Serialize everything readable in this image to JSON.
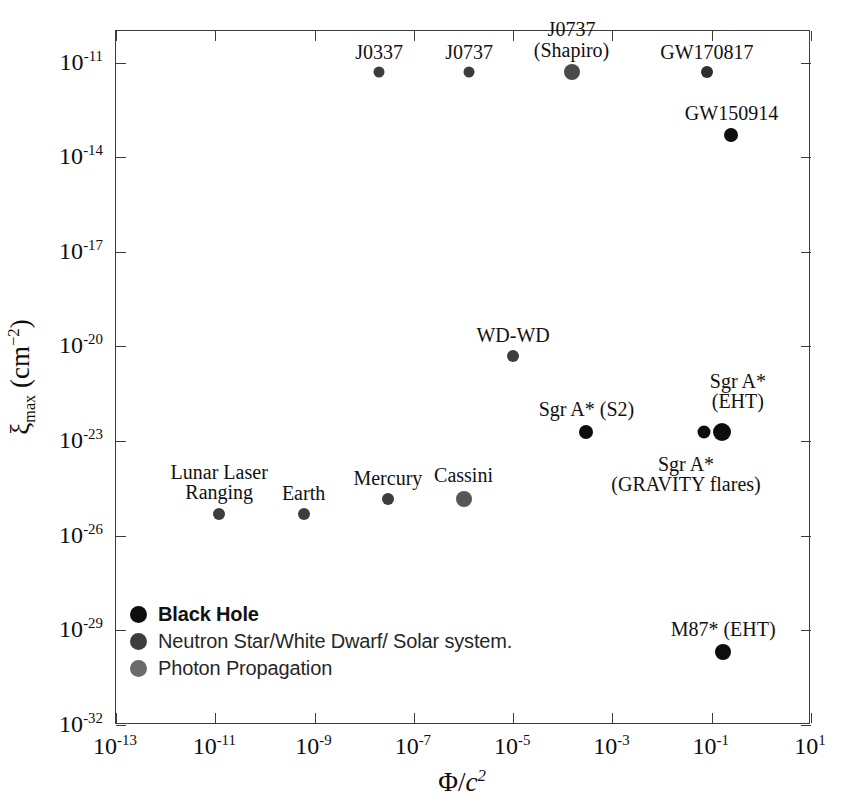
{
  "chart_data": {
    "type": "scatter",
    "title": "",
    "xlabel": "Φ/c²",
    "ylabel": "ξ_max (cm⁻²)",
    "xscale": "log",
    "yscale": "log",
    "xlim": [
      1e-13,
      10
    ],
    "ylim": [
      1e-32,
      1e-10
    ],
    "grid": false,
    "legend_position": "lower-left-inside",
    "xticks": [
      {
        "label_mantissa": "10",
        "exp": "-13",
        "value": 1e-13
      },
      {
        "label_mantissa": "10",
        "exp": "-11",
        "value": 1e-11
      },
      {
        "label_mantissa": "10",
        "exp": "-9",
        "value": 1e-09
      },
      {
        "label_mantissa": "10",
        "exp": "-7",
        "value": 1e-07
      },
      {
        "label_mantissa": "10",
        "exp": "-5",
        "value": 1e-05
      },
      {
        "label_mantissa": "10",
        "exp": "-3",
        "value": 0.001
      },
      {
        "label_mantissa": "10",
        "exp": "-1",
        "value": 0.1
      },
      {
        "label_mantissa": "10",
        "exp": "1",
        "value": 10
      }
    ],
    "yticks": [
      {
        "label_mantissa": "10",
        "exp": "-11",
        "value": 1e-11
      },
      {
        "label_mantissa": "10",
        "exp": "-14",
        "value": 1e-14
      },
      {
        "label_mantissa": "10",
        "exp": "-17",
        "value": 1e-17
      },
      {
        "label_mantissa": "10",
        "exp": "-20",
        "value": 1e-20
      },
      {
        "label_mantissa": "10",
        "exp": "-23",
        "value": 1e-23
      },
      {
        "label_mantissa": "10",
        "exp": "-26",
        "value": 1e-26
      },
      {
        "label_mantissa": "10",
        "exp": "-29",
        "value": 1e-29
      },
      {
        "label_mantissa": "10",
        "exp": "-32",
        "value": 1e-32
      }
    ],
    "legend": [
      {
        "label": "Black Hole",
        "color": "#0d0d0d",
        "category": "black-hole"
      },
      {
        "label": "Neutron Star/White Dwarf/ Solar system.",
        "color": "#3d3d3d",
        "category": "ns-wd-solar"
      },
      {
        "label": "Photon Propagation",
        "color": "#6b6b6b",
        "category": "photon-propagation"
      }
    ],
    "points": [
      {
        "name": "J0337",
        "label": "J0337",
        "x": 2e-08,
        "y": 5e-12,
        "category": "ns-wd-solar",
        "color": "#3d3d3d",
        "size": 11,
        "label_lines": [
          "J0337"
        ],
        "label_dx": 0,
        "label_dy": -30
      },
      {
        "name": "J0737",
        "label": "J0737",
        "x": 1.3e-06,
        "y": 5e-12,
        "category": "ns-wd-solar",
        "color": "#3d3d3d",
        "size": 11,
        "label_lines": [
          "J0737"
        ],
        "label_dx": 0,
        "label_dy": -30
      },
      {
        "name": "J0737 (Shapiro)",
        "label": "J0737 (Shapiro)",
        "x": 0.00015,
        "y": 5e-12,
        "category": "photon-propagation",
        "color": "#4a4a4a",
        "size": 16,
        "label_lines": [
          "J0737",
          "(Shapiro)"
        ],
        "label_dx": 0,
        "label_dy": -53
      },
      {
        "name": "GW170817",
        "label": "GW170817",
        "x": 0.08,
        "y": 5e-12,
        "category": "ns-wd-solar",
        "color": "#2e2e2e",
        "size": 12,
        "label_lines": [
          "GW170817"
        ],
        "label_dx": 0,
        "label_dy": -30
      },
      {
        "name": "GW150914",
        "label": "GW150914",
        "x": 0.25,
        "y": 5e-14,
        "category": "black-hole",
        "color": "#0d0d0d",
        "size": 14,
        "label_lines": [
          "GW150914"
        ],
        "label_dx": 0,
        "label_dy": -32
      },
      {
        "name": "WD-WD",
        "label": "WD-WD",
        "x": 1e-05,
        "y": 5e-21,
        "category": "ns-wd-solar",
        "color": "#3d3d3d",
        "size": 12,
        "label_lines": [
          "WD-WD"
        ],
        "label_dx": 0,
        "label_dy": -31
      },
      {
        "name": "Sgr A* (S2)",
        "label": "Sgr A* (S2)",
        "x": 0.0003,
        "y": 2e-23,
        "category": "black-hole",
        "color": "#0d0d0d",
        "size": 14,
        "label_lines": [
          "Sgr A* (S2)"
        ],
        "label_dx": 0,
        "label_dy": -33
      },
      {
        "name": "Sgr A* (GRAVITY flares)",
        "label": "Sgr A* (GRAVITY flares)",
        "x": 0.07,
        "y": 2e-23,
        "category": "black-hole",
        "color": "#0d0d0d",
        "size": 13,
        "label_lines": [
          "Sgr A*",
          "(GRAVITY flares)"
        ],
        "label_dx": -18,
        "label_dy": 22
      },
      {
        "name": "Sgr A* (EHT)",
        "label": "Sgr A* (EHT)",
        "x": 0.16,
        "y": 2e-23,
        "category": "black-hole",
        "color": "#0d0d0d",
        "size": 18,
        "label_lines": [
          "Sgr A*",
          "(EHT)"
        ],
        "label_dx": 16,
        "label_dy": -61
      },
      {
        "name": "Mercury",
        "label": "Mercury",
        "x": 3e-08,
        "y": 1.5e-25,
        "category": "ns-wd-solar",
        "color": "#3d3d3d",
        "size": 12,
        "label_lines": [
          "Mercury"
        ],
        "label_dx": 0,
        "label_dy": -31
      },
      {
        "name": "Cassini",
        "label": "Cassini",
        "x": 1e-06,
        "y": 1.5e-25,
        "category": "photon-propagation",
        "color": "#565656",
        "size": 16,
        "label_lines": [
          "Cassini"
        ],
        "label_dx": 0,
        "label_dy": -34
      },
      {
        "name": "Lunar Laser Ranging",
        "label": "Lunar Laser Ranging",
        "x": 1.2e-11,
        "y": 5e-26,
        "category": "ns-wd-solar",
        "color": "#3d3d3d",
        "size": 12,
        "label_lines": [
          "Lunar Laser",
          "Ranging"
        ],
        "label_dx": 0,
        "label_dy": -52
      },
      {
        "name": "Earth",
        "label": "Earth",
        "x": 6e-10,
        "y": 5e-26,
        "category": "ns-wd-solar",
        "color": "#3d3d3d",
        "size": 12,
        "label_lines": [
          "Earth"
        ],
        "label_dx": 0,
        "label_dy": -31
      },
      {
        "name": "M87* (EHT)",
        "label": "M87* (EHT)",
        "x": 0.17,
        "y": 2e-30,
        "category": "black-hole",
        "color": "#0d0d0d",
        "size": 16,
        "label_lines": [
          "M87* (EHT)"
        ],
        "label_dx": 0,
        "label_dy": -33
      }
    ]
  },
  "axes": {
    "ylabel_symbol": "ξ",
    "ylabel_sub": "max",
    "ylabel_unit_open": " (cm",
    "ylabel_unit_sup": "−2",
    "ylabel_unit_close": ")",
    "xlabel_phi": "Φ",
    "xlabel_slash": "/",
    "xlabel_c": "c",
    "xlabel_exp": "2"
  }
}
